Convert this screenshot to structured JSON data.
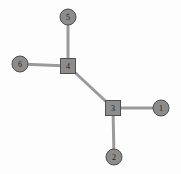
{
  "diagram": {
    "background_color": "#fdfdfd",
    "node_fill_color": "#8c8c8c",
    "node_stroke_color": "#4f4f4f",
    "edge_color": "#9a9a9a",
    "label_color": "#1e1e1e",
    "width": 181,
    "height": 174
  },
  "nodes": [
    {
      "id": "1",
      "label": "1",
      "shape": "circle",
      "x": 161,
      "y": 108,
      "r": 8
    },
    {
      "id": "2",
      "label": "2",
      "shape": "circle",
      "x": 114,
      "y": 157,
      "r": 8
    },
    {
      "id": "3",
      "label": "3",
      "shape": "square",
      "x": 113,
      "y": 108,
      "size": 15
    },
    {
      "id": "4",
      "label": "4",
      "shape": "square",
      "x": 68,
      "y": 66,
      "size": 15
    },
    {
      "id": "5",
      "label": "5",
      "shape": "circle",
      "x": 68,
      "y": 17,
      "r": 8
    },
    {
      "id": "6",
      "label": "6",
      "shape": "circle",
      "x": 20,
      "y": 64,
      "r": 8
    }
  ],
  "edges": [
    {
      "from": "3",
      "to": "1"
    },
    {
      "from": "3",
      "to": "2"
    },
    {
      "from": "3",
      "to": "4"
    },
    {
      "from": "4",
      "to": "5"
    },
    {
      "from": "4",
      "to": "6"
    }
  ]
}
